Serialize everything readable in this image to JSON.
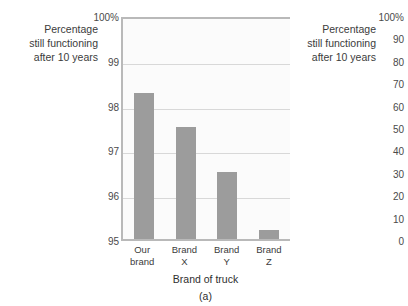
{
  "chart_data": [
    {
      "type": "bar",
      "panel": "(a)",
      "title": "",
      "categories": [
        "Our brand",
        "Brand X",
        "Brand Y",
        "Brand Z"
      ],
      "values": [
        98.25,
        97.5,
        96.5,
        95.2
      ],
      "xlabel": "Brand of truck",
      "ylabel": "Percentage still functioning after 10 years",
      "ylim": [
        95,
        100
      ],
      "ytick_labels": [
        "100%",
        "99",
        "98",
        "97",
        "96",
        "95"
      ],
      "ytick_values": [
        100,
        99,
        98,
        97,
        96,
        95
      ],
      "grid": true,
      "legend": "none",
      "bar_color": "#9c9c9c",
      "plot_background": "#fbfbfb"
    },
    {
      "type": "bar",
      "panel": "(b)",
      "note": "cropped at right edge of screenshot; only axis labels visible",
      "title": "",
      "categories": [],
      "values": [],
      "xlabel": "",
      "ylabel": "Percentage still functioning after 10 years",
      "ylim": [
        0,
        100
      ],
      "ytick_labels": [
        "100%",
        "90",
        "80",
        "70",
        "60",
        "50",
        "40",
        "30",
        "20",
        "10",
        "0"
      ],
      "ytick_values": [
        100,
        90,
        80,
        70,
        60,
        50,
        40,
        30,
        20,
        10,
        0
      ],
      "grid": true,
      "legend": "none"
    }
  ],
  "chart_a": {
    "axis_title": "Percentage\nstill functioning\nafter 10 years",
    "axis_title_lines": [
      "Percentage",
      "still functioning",
      "after 10 years"
    ],
    "xlabel": "Brand of truck",
    "caption": "(a)",
    "yticks": [
      {
        "label": "100%",
        "value": 100
      },
      {
        "label": "99",
        "value": 99
      },
      {
        "label": "98",
        "value": 98
      },
      {
        "label": "97",
        "value": 97
      },
      {
        "label": "96",
        "value": 96
      },
      {
        "label": "95",
        "value": 95
      }
    ],
    "bars": [
      {
        "label_line1": "Our",
        "label_line2": "brand",
        "value": 98.25
      },
      {
        "label_line1": "Brand",
        "label_line2": "X",
        "value": 97.5
      },
      {
        "label_line1": "Brand",
        "label_line2": "Y",
        "value": 96.5
      },
      {
        "label_line1": "Brand",
        "label_line2": "Z",
        "value": 95.2
      }
    ]
  },
  "chart_b": {
    "axis_title_lines": [
      "Percentage",
      "still functioning",
      "after 10 years"
    ],
    "yticks": [
      {
        "label": "100%",
        "value": 100
      },
      {
        "label": "90",
        "value": 90
      },
      {
        "label": "80",
        "value": 80
      },
      {
        "label": "70",
        "value": 70
      },
      {
        "label": "60",
        "value": 60
      },
      {
        "label": "50",
        "value": 50
      },
      {
        "label": "40",
        "value": 40
      },
      {
        "label": "30",
        "value": 30
      },
      {
        "label": "20",
        "value": 20
      },
      {
        "label": "10",
        "value": 10
      },
      {
        "label": "0",
        "value": 0
      }
    ]
  }
}
